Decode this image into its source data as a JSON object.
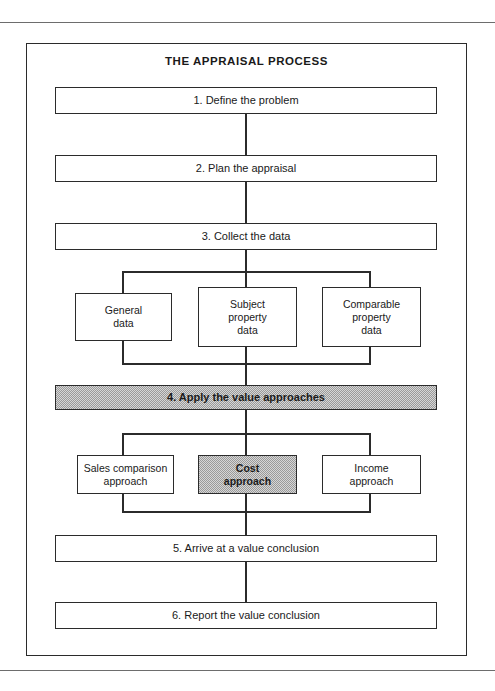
{
  "figure": {
    "title": "THE APPRAISAL PROCESS",
    "frame_color": "#2b2b2b",
    "shade_color": "#d6d6d6",
    "page_background": "#ffffff"
  },
  "steps": [
    {
      "id": "step-1",
      "label": "1. Define the problem",
      "shaded": false
    },
    {
      "id": "step-2",
      "label": "2.  Plan the appraisal",
      "shaded": false
    },
    {
      "id": "step-3",
      "label": "3.  Collect the data",
      "shaded": false
    },
    {
      "id": "step-4",
      "label": "4.  Apply the value approaches",
      "shaded": true
    },
    {
      "id": "step-5",
      "label": "5.  Arrive at a value conclusion",
      "shaded": false
    },
    {
      "id": "step-6",
      "label": "6.  Report the value conclusion",
      "shaded": false
    }
  ],
  "data_types": [
    {
      "id": "general-data",
      "line1": "General",
      "line2": "data",
      "line3": "",
      "shaded": false
    },
    {
      "id": "subject-property-data",
      "line1": "Subject",
      "line2": "property",
      "line3": "data",
      "shaded": false
    },
    {
      "id": "comparable-property-data",
      "line1": "Comparable",
      "line2": "property",
      "line3": "data",
      "shaded": false
    }
  ],
  "approaches": [
    {
      "id": "sales-comparison-approach",
      "line1": "Sales comparison",
      "line2": "approach",
      "shaded": false
    },
    {
      "id": "cost-approach",
      "line1": "Cost",
      "line2": "approach",
      "shaded": true
    },
    {
      "id": "income-approach",
      "line1": "Income",
      "line2": "approach",
      "shaded": false
    }
  ]
}
